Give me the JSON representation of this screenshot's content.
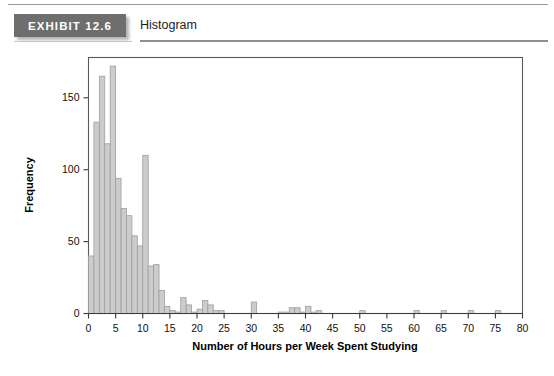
{
  "header": {
    "exhibit_tag": "EXHIBIT 12.6",
    "title": "Histogram",
    "tag_color": "#6e6e6e",
    "rule_color": "#8e8e8e"
  },
  "chart_data": {
    "type": "bar",
    "title": "Histogram",
    "xlabel": "Number of Hours per Week Spent Studying",
    "ylabel": "Frequency",
    "xlim": [
      0,
      80
    ],
    "ylim": [
      0,
      178
    ],
    "grid": false,
    "legend": null,
    "bin_width": 1,
    "bar_color": "#cccccc",
    "bar_edge_color": "#9e9e9e",
    "xticks": [
      0,
      5,
      10,
      15,
      20,
      25,
      30,
      35,
      40,
      45,
      50,
      55,
      60,
      65,
      70,
      75,
      80
    ],
    "xtick_labels": [
      "0",
      "5",
      "10",
      "15",
      "20",
      "25",
      "30",
      "35",
      "40",
      "45",
      "50",
      "55",
      "60",
      "65",
      "70",
      "75",
      "80"
    ],
    "yticks": [
      0,
      50,
      100,
      150
    ],
    "ytick_labels": [
      "0",
      "50",
      "100",
      "150"
    ],
    "categories": [
      0,
      1,
      2,
      3,
      4,
      5,
      6,
      7,
      8,
      9,
      10,
      11,
      12,
      13,
      14,
      15,
      16,
      17,
      18,
      19,
      20,
      21,
      22,
      23,
      24,
      25,
      26,
      27,
      28,
      29,
      30,
      31,
      32,
      33,
      34,
      35,
      36,
      37,
      38,
      39,
      40,
      41,
      42,
      43,
      44,
      45,
      46,
      47,
      48,
      49,
      50,
      51,
      52,
      53,
      54,
      55,
      56,
      57,
      58,
      59,
      60,
      61,
      62,
      63,
      64,
      65,
      66,
      67,
      68,
      69,
      70,
      71,
      72,
      73,
      74,
      75,
      76,
      77,
      78,
      79
    ],
    "values": [
      40,
      133,
      165,
      118,
      172,
      94,
      73,
      68,
      54,
      47,
      110,
      33,
      34,
      16,
      5,
      2,
      1,
      11,
      6,
      1,
      3,
      9,
      6,
      2,
      2,
      0,
      0,
      0,
      0,
      0,
      8,
      0,
      0,
      0,
      0,
      1,
      1,
      4,
      4,
      1,
      5,
      1,
      2,
      0,
      0,
      0,
      0,
      0,
      0,
      0,
      2,
      0,
      0,
      0,
      0,
      0,
      0,
      0,
      0,
      0,
      2,
      0,
      0,
      0,
      0,
      2,
      0,
      0,
      0,
      0,
      2,
      0,
      0,
      0,
      0,
      2,
      0,
      0,
      0,
      0
    ]
  }
}
